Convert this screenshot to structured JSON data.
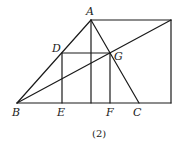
{
  "figure": {
    "caption": "(2)",
    "points": {
      "A": {
        "label": "A",
        "x": 91,
        "y": 20
      },
      "B": {
        "label": "B",
        "x": 17,
        "y": 103
      },
      "C": {
        "label": "C",
        "x": 139,
        "y": 103
      },
      "D": {
        "label": "D",
        "x": 62,
        "y": 53
      },
      "E": {
        "label": "E",
        "x": 62,
        "y": 103
      },
      "F": {
        "label": "F",
        "x": 110,
        "y": 103
      },
      "G": {
        "label": "G",
        "x": 110,
        "y": 53
      }
    },
    "segments": [
      "AB",
      "AC",
      "BC-extended",
      "A-top-right",
      "top-right-down",
      "B-top-right",
      "DE",
      "DG",
      "GF",
      "A-foot"
    ]
  }
}
